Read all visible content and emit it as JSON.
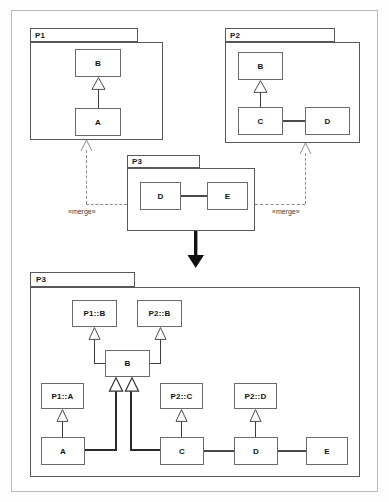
{
  "diagram": {
    "notation": "uml-package-merge",
    "colors": {
      "frame_border": "#b9b9b9",
      "package_border": "#58585a",
      "class_border": "#6b6b6d",
      "class_fill": "#ffffff",
      "link": "#3a3a3a",
      "thick_link": "#2a2a2a",
      "dependency": "#8d8d8f",
      "big_arrow": "#111111",
      "text": "#121212"
    }
  },
  "before": {
    "packages": [
      {
        "name": "P1",
        "label": "P1",
        "classes": [
          {
            "id": "p1-b",
            "label": "B"
          },
          {
            "id": "p1-a",
            "label": "A"
          }
        ],
        "generalizations": [
          {
            "from": "A",
            "to": "B"
          }
        ]
      },
      {
        "name": "P2",
        "label": "P2",
        "classes": [
          {
            "id": "p2-b",
            "label": "B"
          },
          {
            "id": "p2-c",
            "label": "C"
          },
          {
            "id": "p2-d",
            "label": "D"
          }
        ],
        "generalizations": [
          {
            "from": "C",
            "to": "B"
          }
        ],
        "associations": [
          {
            "from": "C",
            "to": "D"
          }
        ]
      },
      {
        "name": "P3",
        "label": "P3",
        "classes": [
          {
            "id": "p3-d",
            "label": "D"
          },
          {
            "id": "p3-e",
            "label": "E"
          }
        ],
        "associations": [
          {
            "from": "D",
            "to": "E"
          }
        ]
      }
    ],
    "dependencies": [
      {
        "id": "merge-left",
        "stereotype": "«merge»",
        "from": "P3",
        "to": "P1"
      },
      {
        "id": "merge-right",
        "stereotype": "«merge»",
        "from": "P3",
        "to": "P2"
      }
    ]
  },
  "transform_arrow": {
    "name": "result-arrow",
    "direction": "down"
  },
  "after": {
    "package": {
      "name": "P3",
      "label": "P3",
      "classes": [
        {
          "id": "r-p1b",
          "label": "P1::B"
        },
        {
          "id": "r-p2b",
          "label": "P2::B"
        },
        {
          "id": "r-b",
          "label": "B"
        },
        {
          "id": "r-p1a",
          "label": "P1::A"
        },
        {
          "id": "r-p2c",
          "label": "P2::C"
        },
        {
          "id": "r-p2d",
          "label": "P2::D"
        },
        {
          "id": "r-a",
          "label": "A"
        },
        {
          "id": "r-c",
          "label": "C"
        },
        {
          "id": "r-d",
          "label": "D"
        },
        {
          "id": "r-e",
          "label": "E"
        }
      ],
      "generalizations": [
        {
          "from": "B",
          "to": "P1::B"
        },
        {
          "from": "B",
          "to": "P2::B"
        },
        {
          "from": "A",
          "to": "P1::A"
        },
        {
          "from": "C",
          "to": "P2::C"
        },
        {
          "from": "D",
          "to": "P2::D"
        },
        {
          "from": "A",
          "to": "B"
        },
        {
          "from": "C",
          "to": "B"
        }
      ],
      "associations": [
        {
          "from": "C",
          "to": "D"
        },
        {
          "from": "D",
          "to": "E"
        }
      ]
    }
  }
}
